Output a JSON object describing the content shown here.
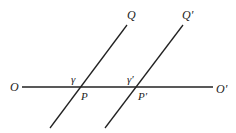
{
  "diagram": {
    "lines": {
      "horizontal": {
        "name": "OO'",
        "x1": 22,
        "y1": 87,
        "x2": 213,
        "y2": 87
      },
      "transversal_1": {
        "name": "PQ",
        "x1": 50,
        "y1": 128,
        "x2": 127,
        "y2": 25
      },
      "transversal_2": {
        "name": "P'Q'",
        "x1": 105,
        "y1": 128,
        "x2": 183,
        "y2": 25
      }
    },
    "labels": {
      "O": "O",
      "O_prime": "O′",
      "Q": "Q",
      "Q_prime": "Q′",
      "gamma": "γ",
      "gamma_prime": "γ′",
      "P": "P",
      "P_prime": "P′"
    },
    "line_color": "#222222"
  }
}
